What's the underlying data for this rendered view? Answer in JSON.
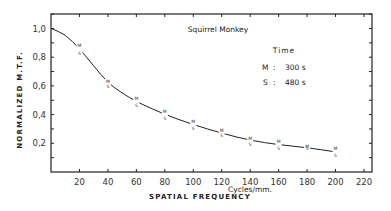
{
  "chart_data": {
    "type": "line",
    "title": "Squirrel Monkey",
    "xlabel": "SPATIAL FREQUENCY",
    "xunit": "Cycles/mm.",
    "ylabel": "NORMALIZED  M.T.F.",
    "xlim": [
      0,
      220
    ],
    "ylim": [
      0,
      1.1
    ],
    "xticks": [
      20,
      40,
      60,
      80,
      100,
      120,
      140,
      160,
      180,
      200,
      220
    ],
    "yticks": [
      "0,2",
      "0,4",
      "0,6",
      "0,8",
      "1,0"
    ],
    "ytick_values": [
      0.2,
      0.4,
      0.6,
      0.8,
      1.0
    ],
    "grid": false,
    "legend": {
      "title": "Time",
      "entries": [
        {
          "marker": "M",
          "sep": ":",
          "value": "300 s"
        },
        {
          "marker": "S",
          "sep": ":",
          "value": "480 s"
        }
      ]
    },
    "x": [
      0,
      20,
      40,
      60,
      80,
      100,
      120,
      140,
      160,
      180,
      200
    ],
    "series": [
      {
        "name": "M (300 s)",
        "values": [
          1.0,
          0.87,
          0.62,
          0.5,
          0.41,
          0.34,
          0.28,
          0.22,
          0.2,
          0.17,
          0.15
        ]
      },
      {
        "name": "S (480 s)",
        "values": [
          1.0,
          0.84,
          0.61,
          0.48,
          0.39,
          0.32,
          0.27,
          0.21,
          0.18,
          0.18,
          0.13
        ]
      }
    ],
    "fitted_curve": [
      [
        0,
        1.0
      ],
      [
        10,
        0.96
      ],
      [
        20,
        0.86
      ],
      [
        30,
        0.74
      ],
      [
        40,
        0.62
      ],
      [
        50,
        0.55
      ],
      [
        60,
        0.49
      ],
      [
        80,
        0.4
      ],
      [
        100,
        0.33
      ],
      [
        120,
        0.27
      ],
      [
        140,
        0.22
      ],
      [
        160,
        0.19
      ],
      [
        180,
        0.17
      ],
      [
        200,
        0.14
      ]
    ]
  }
}
